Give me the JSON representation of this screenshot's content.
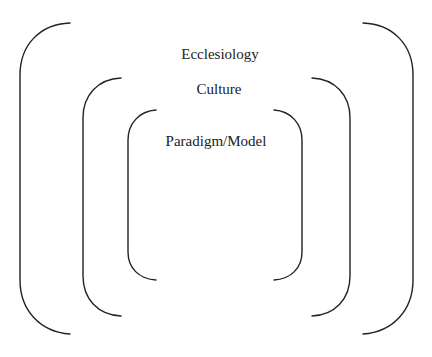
{
  "diagram": {
    "type": "nested-brackets",
    "layers": [
      {
        "id": "outer",
        "label": "Ecclesiology"
      },
      {
        "id": "middle",
        "label": "Culture"
      },
      {
        "id": "inner",
        "label": "Paradigm/Model"
      }
    ],
    "colors": {
      "stroke": "#222222",
      "text": "#222222",
      "background": "#ffffff"
    }
  }
}
